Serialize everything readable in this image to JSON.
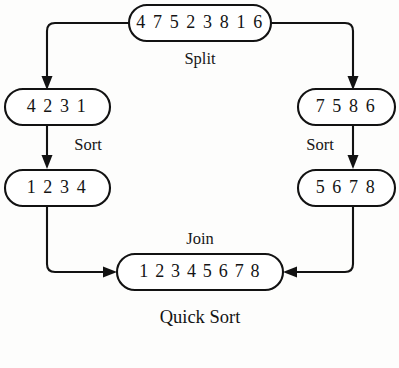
{
  "diagram": {
    "title": "Quick Sort",
    "nodes": {
      "root": {
        "label": "4 7 5 2 3 8 1 6",
        "name": "unsorted-array-node"
      },
      "left_split": {
        "label": "4 2 3 1",
        "name": "left-partition-node"
      },
      "right_split": {
        "label": "7 5  8 6",
        "name": "right-partition-node"
      },
      "left_sorted": {
        "label": "1 2 3 4",
        "name": "left-sorted-node"
      },
      "right_sorted": {
        "label": "5 6 7 8",
        "name": "right-sorted-node"
      },
      "merged": {
        "label": "1 2 3 4 5 6 7 8",
        "name": "merged-sorted-node"
      }
    },
    "edge_labels": {
      "split": "Split",
      "sort_left": "Sort",
      "sort_right": "Sort",
      "join": "Join"
    },
    "colors": {
      "stroke": "#121212",
      "node_fill": "#ffffff",
      "background": "#fdfdfc",
      "text": "#141414"
    }
  }
}
